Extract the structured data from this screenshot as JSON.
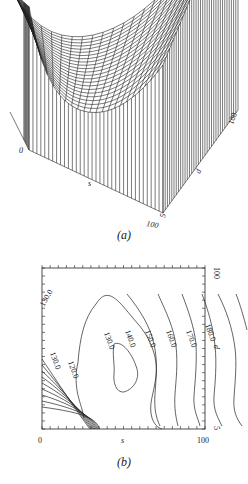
{
  "figures": [
    {
      "caption": "(a)",
      "type": "3d-surface-wireframe",
      "axes": {
        "s": {
          "label": "s",
          "min": "0",
          "max": "100"
        },
        "d": {
          "label": "d",
          "min": "5",
          "max": "100"
        }
      }
    },
    {
      "caption": "(b)",
      "type": "contour",
      "axes": {
        "x": {
          "label": "s",
          "min": "0",
          "max": "100"
        },
        "y": {
          "label": "d",
          "min": "5",
          "max": "100"
        }
      },
      "contour_labels": [
        "120.0",
        "130.0",
        "130.0",
        "130.0",
        "140.0",
        "150.0",
        "160.0",
        "170.0",
        "180.0"
      ]
    }
  ],
  "chart_data": [
    {
      "type": "surface",
      "title": "(a)",
      "xlabel": "s",
      "ylabel": "d",
      "x_range": [
        0,
        100
      ],
      "y_range": [
        5,
        100
      ],
      "description": "Wireframe surface with minimum valley near low-to-mid s; surface rises steeply at s=0 corner and toward s=100, d=100."
    },
    {
      "type": "contour",
      "title": "(b)",
      "xlabel": "s",
      "ylabel": "d",
      "xlim": [
        0,
        100
      ],
      "ylim": [
        5,
        100
      ],
      "levels": [
        120.0,
        130.0,
        140.0,
        150.0,
        160.0,
        170.0,
        180.0
      ],
      "minimum_region": {
        "s_approx": 25,
        "d_approx": 45,
        "level": 120.0
      }
    }
  ]
}
